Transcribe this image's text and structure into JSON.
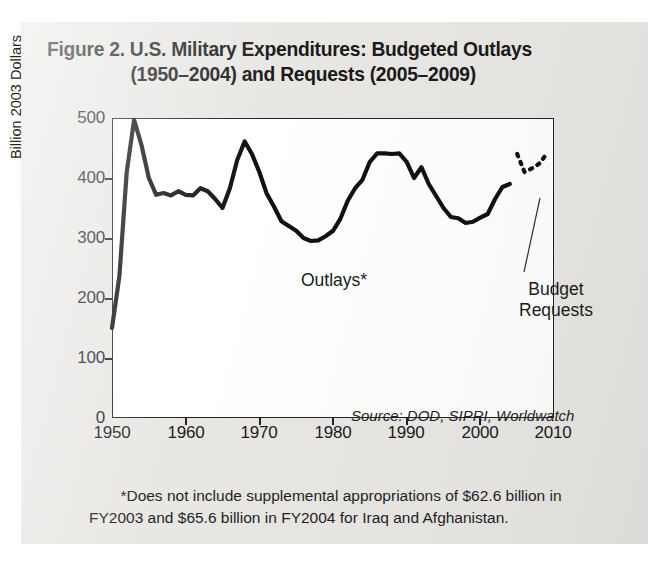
{
  "title": {
    "line1": "Figure 2. U.S. Military Expenditures: Budgeted Outlays",
    "line2": "(1950–2004) and Requests (2005–2009)"
  },
  "annotations": {
    "outlays": "Outlays*",
    "budget_requests_line1": "Budget",
    "budget_requests_line2": "Requests",
    "source": "Source: DOD, SIPRI, Worldwatch"
  },
  "footnote": {
    "line1": "*Does not include supplemental appropriations of $62.6 billion in",
    "line2": "FY2003 and $65.6 billion in FY2004 for Iraq and Afghanistan."
  },
  "colors": {
    "panel_background": "#e8e7e4",
    "plot_background": "#ffffff",
    "axis": "#222222",
    "series_line": "#111111",
    "text": "#1c1c1c"
  },
  "chart_data": {
    "type": "line",
    "title": "Figure 2. U.S. Military Expenditures: Budgeted Outlays (1950–2004) and Requests (2005–2009)",
    "xlabel": "",
    "ylabel": "Billion 2003 Dollars",
    "xlim": [
      1950,
      2010
    ],
    "ylim": [
      0,
      500
    ],
    "xticks": [
      1950,
      1960,
      1970,
      1980,
      1990,
      2000,
      2010
    ],
    "yticks": [
      0,
      100,
      200,
      300,
      400,
      500
    ],
    "grid": false,
    "legend": "none",
    "annotations": [
      {
        "text": "Outlays*",
        "x": 1977,
        "y": 255,
        "note": "labels the solid line"
      },
      {
        "text": "Budget Requests",
        "x": 2004,
        "y": 255,
        "note": "labels the dotted line with leader"
      },
      {
        "text": "Source: DOD, SIPRI, Worldwatch",
        "x": 2002,
        "y": 60,
        "style": "italic"
      }
    ],
    "series": [
      {
        "name": "Outlays*",
        "style": "solid",
        "x": [
          1950,
          1951,
          1952,
          1953,
          1954,
          1955,
          1956,
          1957,
          1958,
          1959,
          1960,
          1961,
          1962,
          1963,
          1964,
          1965,
          1966,
          1967,
          1968,
          1969,
          1970,
          1971,
          1972,
          1973,
          1974,
          1975,
          1976,
          1977,
          1978,
          1979,
          1980,
          1981,
          1982,
          1983,
          1984,
          1985,
          1986,
          1987,
          1988,
          1989,
          1990,
          1991,
          1992,
          1993,
          1994,
          1995,
          1996,
          1997,
          1998,
          1999,
          2000,
          2001,
          2002,
          2003,
          2004
        ],
        "values": [
          150,
          236,
          410,
          497,
          455,
          400,
          372,
          375,
          371,
          378,
          372,
          371,
          383,
          378,
          365,
          350,
          383,
          430,
          461,
          440,
          410,
          374,
          352,
          328,
          320,
          312,
          300,
          295,
          296,
          303,
          312,
          332,
          362,
          383,
          397,
          427,
          441,
          441,
          440,
          441,
          427,
          400,
          418,
          390,
          370,
          350,
          335,
          333,
          325,
          327,
          334,
          340,
          365,
          385,
          390
        ]
      },
      {
        "name": "Budget Requests",
        "style": "dotted",
        "x": [
          2005,
          2006,
          2007,
          2008,
          2009
        ],
        "values": [
          440,
          410,
          416,
          424,
          440
        ]
      }
    ]
  }
}
